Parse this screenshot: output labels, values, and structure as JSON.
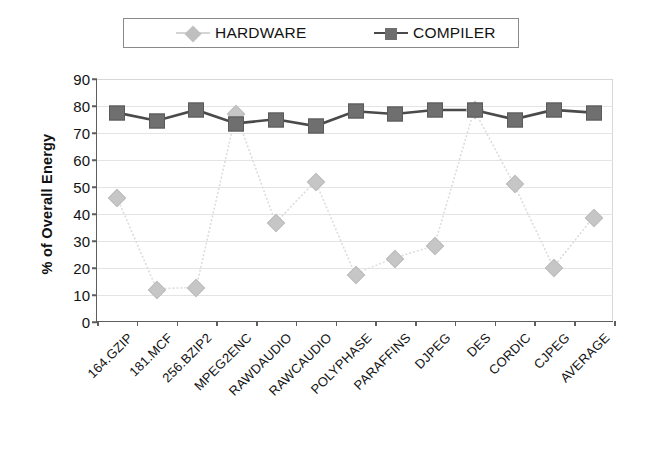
{
  "legend": {
    "position": "top",
    "entries": [
      {
        "label": "HARDWARE",
        "marker": "diamond-marker",
        "color": "#c6c6c6",
        "line_color": "#d5d5d5"
      },
      {
        "label": "COMPILER",
        "marker": "square-marker",
        "color": "#6f6f6f",
        "line_color": "#4a4a4a"
      }
    ]
  },
  "axes": {
    "y_title": "% of Overall Energy",
    "y_ticks": [
      "0",
      "10",
      "20",
      "30",
      "40",
      "50",
      "60",
      "70",
      "80",
      "90"
    ]
  },
  "chart_data": {
    "type": "line",
    "title": "",
    "xlabel": "",
    "ylabel": "% of Overall Energy",
    "ylim": [
      0,
      90
    ],
    "ytick_step": 10,
    "grid": true,
    "legend_position": "top",
    "categories": [
      "164.GZIP",
      "181.MCF",
      "256.BZIP2",
      "MPEG2ENC",
      "RAWDAUDIO",
      "RAWCAUDIO",
      "POLYPHASE",
      "PARAFFINS",
      "DJPEG",
      "DES",
      "CORDIC",
      "CJPEG",
      "AVERAGE"
    ],
    "series": [
      {
        "name": "HARDWARE",
        "color": "#c6c6c6",
        "marker": "diamond",
        "values": [
          46,
          12,
          12.5,
          77,
          36.5,
          52,
          17.5,
          23.5,
          28,
          78.5,
          51,
          20,
          38.5
        ]
      },
      {
        "name": "COMPILER",
        "color": "#6f6f6f",
        "marker": "square",
        "values": [
          77.5,
          74.5,
          78.5,
          73.5,
          75,
          72.5,
          78,
          77,
          78.5,
          78.5,
          75,
          78.5,
          77.5
        ]
      }
    ]
  }
}
